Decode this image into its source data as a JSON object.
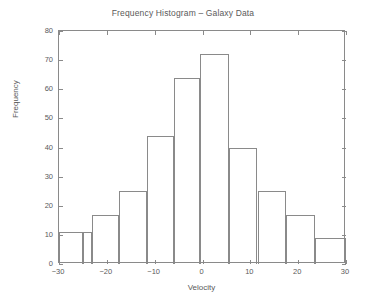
{
  "chart_data": {
    "type": "bar",
    "title": "Frequency Histogram – Galaxy Data",
    "xlabel": "Velocity",
    "ylabel": "Frequency",
    "xlim": [
      -30,
      30
    ],
    "ylim": [
      0,
      80
    ],
    "xticks": [
      -30,
      -20,
      -10,
      0,
      10,
      20,
      30
    ],
    "xtick_labels": [
      "−30",
      "−20",
      "−10",
      "0",
      "10",
      "20",
      "30"
    ],
    "yticks": [
      0,
      10,
      20,
      30,
      40,
      50,
      60,
      70,
      80
    ],
    "ytick_labels": [
      "0",
      "10",
      "20",
      "30",
      "40",
      "50",
      "60",
      "70",
      "80"
    ],
    "grid": false,
    "legend": "none",
    "bin_width": 5,
    "bin_edges": [
      -30,
      -25,
      -20,
      -15,
      -10,
      -5,
      0,
      5,
      10,
      15,
      20,
      25,
      30
    ],
    "categories": [
      "-30 to -25",
      "-25 to -20",
      "-20 to -15",
      "-15 to -10",
      "-10 to -5",
      "-5 to 0",
      "0 to 5",
      "5 to 10",
      "10 to 15",
      "15 to 20",
      "20 to 25",
      "25 to 30"
    ],
    "values": [
      11,
      11,
      17,
      25,
      44,
      64,
      72,
      40,
      40,
      25,
      17,
      9
    ],
    "bars": [
      {
        "x0": -30,
        "x1": -25,
        "value": 11
      },
      {
        "x0": -25,
        "x1": -23,
        "value": 11
      },
      {
        "x0": -23,
        "x1": -17.5,
        "value": 17
      },
      {
        "x0": -17.5,
        "x1": -11.5,
        "value": 25
      },
      {
        "x0": -11.5,
        "x1": -6,
        "value": 44
      },
      {
        "x0": -6,
        "x1": -0.5,
        "value": 64
      },
      {
        "x0": -0.5,
        "x1": 5.5,
        "value": 72
      },
      {
        "x0": 5.5,
        "x1": 11.5,
        "value": 40
      },
      {
        "x0": 11.5,
        "x1": 17.5,
        "value": 25
      },
      {
        "x0": 17.5,
        "x1": 23.5,
        "value": 17
      },
      {
        "x0": 23.5,
        "x1": 30,
        "value": 9
      }
    ],
    "colors": {
      "background": "#ffffff",
      "axis": "#8a8a8a",
      "bar_edge": "#8a8a8a",
      "bar_fill": "none",
      "text": "#5a5a5a"
    }
  }
}
